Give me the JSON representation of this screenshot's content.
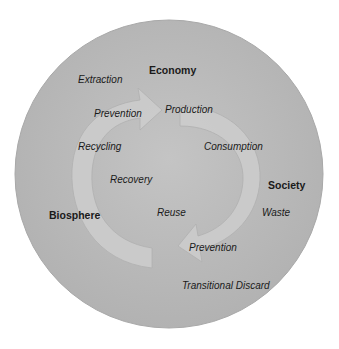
{
  "diagram": {
    "colors": {
      "circle_fill": "#bdbdbd",
      "circle_edge": "#a8a8a8",
      "arrow_fill": "#cfcfcf",
      "arrow_stroke": "#b3b3b3",
      "text": "#1a1a1a"
    },
    "domains": {
      "economy": "Economy",
      "society": "Society",
      "biosphere": "Biosphere"
    },
    "processes": {
      "extraction": "Extraction",
      "prevention_top": "Prevention",
      "production": "Production",
      "recycling": "Recycling",
      "consumption": "Consumption",
      "recovery": "Recovery",
      "reuse": "Reuse",
      "waste": "Waste",
      "prevention_bottom": "Prevention",
      "transitional_discard": "Transitional Discard"
    }
  }
}
